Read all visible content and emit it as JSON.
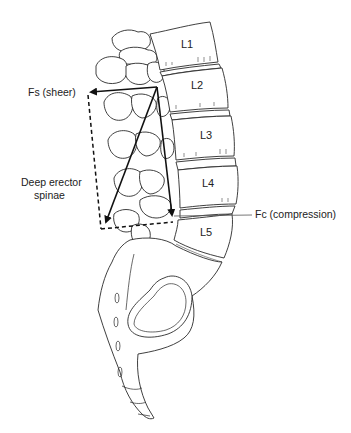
{
  "diagram": {
    "vertebrae": [
      {
        "id": "L1",
        "label": "L1",
        "x": 187,
        "y": 48
      },
      {
        "id": "L2",
        "label": "L2",
        "x": 197,
        "y": 89
      },
      {
        "id": "L3",
        "label": "L3",
        "x": 206,
        "y": 136
      },
      {
        "id": "L4",
        "label": "L4",
        "x": 208,
        "y": 184
      },
      {
        "id": "L5",
        "label": "L5",
        "x": 206,
        "y": 236
      }
    ],
    "labels": {
      "shear": "Fs (sheer)",
      "compression": "Fc (compression)",
      "muscle_line1": "Deep erector",
      "muscle_line2": "spinae"
    },
    "forces": {
      "apex": [
        157,
        87
      ],
      "shear_tip": [
        89,
        92
      ],
      "compression_tip": [
        172,
        217
      ],
      "muscle_tip": [
        104,
        224
      ],
      "dashed_corner": [
        101,
        229
      ],
      "dashed_top": [
        88,
        95
      ],
      "dashed_right": [
        173,
        222
      ]
    },
    "colors": {
      "line": "#111111",
      "bone_stroke": "#2a2a2a",
      "background": "#ffffff"
    }
  }
}
